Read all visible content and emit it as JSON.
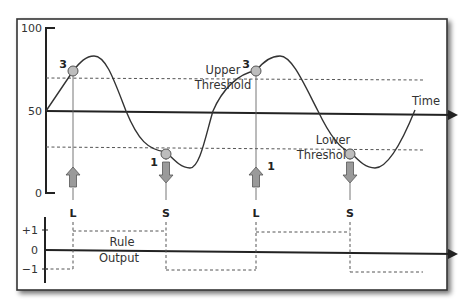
{
  "upper_chart": {
    "y_ticks": [
      {
        "label": "100",
        "y": 28
      },
      {
        "label": "50",
        "y": 111
      },
      {
        "label": "0",
        "y": 193
      }
    ],
    "x_axis_label": "Time",
    "upper_threshold": {
      "line1": "Upper",
      "line2": "Threshold"
    },
    "lower_threshold": {
      "line1": "Lower",
      "line2": "Threshold"
    },
    "points": [
      {
        "label": "3",
        "type": "upper-cross",
        "signal": "L",
        "direction": "up"
      },
      {
        "label": "1",
        "type": "lower-cross",
        "signal": "S",
        "direction": "down"
      },
      {
        "label": "3",
        "type": "upper-cross",
        "signal": "L",
        "direction": "up"
      },
      {
        "label": "1",
        "type": "lower-cross",
        "signal": "S",
        "direction": "down"
      }
    ],
    "signals": [
      "L",
      "S",
      "L",
      "S"
    ]
  },
  "lower_chart": {
    "y_ticks": [
      {
        "label": "+1",
        "y": 230
      },
      {
        "label": "0",
        "y": 250
      },
      {
        "label": "−1",
        "y": 269
      }
    ],
    "title": {
      "line1": "Rule",
      "line2": "Output"
    },
    "output_sequence": [
      -1,
      1,
      -1,
      1,
      -1
    ]
  },
  "colors": {
    "axis": "#222222",
    "curve": "#333333",
    "threshold": "#555555",
    "marker_fill": "#bdbdbd",
    "arrow_fill": "#9a9a9a",
    "frame": "#333333"
  }
}
